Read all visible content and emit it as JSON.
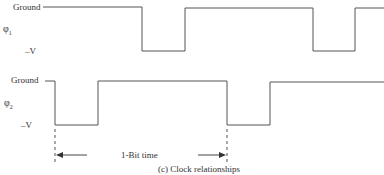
{
  "diagram": {
    "caption": "(c) Clock relationships",
    "bit_time_label": "1-Bit time",
    "signals": [
      {
        "name": "φ1",
        "symbol": "φ",
        "subscript": "1",
        "high_label": "Ground",
        "low_label": "–V",
        "transitions_x": [
          142,
          185,
          313,
          355
        ]
      },
      {
        "name": "φ2",
        "symbol": "φ",
        "subscript": "2",
        "high_label": "Ground",
        "low_label": "–V",
        "transitions_x": [
          55,
          98,
          227,
          270
        ]
      }
    ],
    "line_color": "#555555"
  }
}
